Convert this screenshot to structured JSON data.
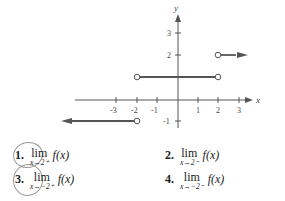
{
  "graph": {
    "x_axis_label": "x",
    "y_axis_label": "y",
    "x_ticks": [
      "-3",
      "-2",
      "-1",
      "1",
      "2",
      "3"
    ],
    "y_ticks": [
      "3",
      "2",
      "-1"
    ],
    "line_color": "#555555",
    "segments": [
      {
        "from": [
          -2,
          1
        ],
        "to": [
          2,
          1
        ],
        "left_open": true,
        "right_open": true
      },
      {
        "from": [
          2,
          2
        ],
        "to": [
          3.5,
          2
        ],
        "left_open": true,
        "arrow": "right"
      },
      {
        "from": [
          -4,
          -1
        ],
        "to": [
          -2,
          -1
        ],
        "right_open": true,
        "arrow": "left"
      }
    ]
  },
  "exercises": [
    {
      "number": "1.",
      "lim": "lim",
      "approach": "x→2⁺",
      "expr": "f(x)",
      "circled": true
    },
    {
      "number": "2.",
      "lim": "lim",
      "approach": "x→2⁻",
      "expr": "f(x)",
      "circled": false
    },
    {
      "number": "3.",
      "lim": "lim",
      "approach": "x→−2⁺",
      "expr": "f(x)",
      "circled": true
    },
    {
      "number": "4.",
      "lim": "lim",
      "approach": "x→−2⁻",
      "expr": "f(x)",
      "circled": false
    }
  ]
}
